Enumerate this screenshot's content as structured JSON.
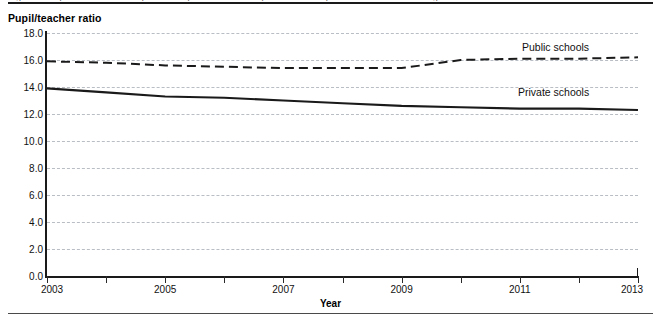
{
  "figure": {
    "clipped_header": "Figure 4. Pupil/teacher ratios in public and private elementary and secondary schools: Fall 2003 through fall 2013",
    "y_axis_title": "Pupil/teacher ratio",
    "x_axis_title": "Year"
  },
  "chart_data": {
    "type": "line",
    "title": "",
    "xlabel": "Year",
    "ylabel": "Pupil/teacher ratio",
    "x": [
      2003,
      2004,
      2005,
      2006,
      2007,
      2008,
      2009,
      2010,
      2011,
      2012,
      2013
    ],
    "xlim": [
      2003,
      2013
    ],
    "ylim": [
      0.0,
      18.0
    ],
    "grid": true,
    "grid_axis": "y",
    "legend_position": "inline-right",
    "x_tick_labels": [
      "2003",
      "2005",
      "2007",
      "2009",
      "2011",
      "2013"
    ],
    "x_tick_values": [
      2003,
      2005,
      2007,
      2009,
      2011,
      2013
    ],
    "x_minor_ticks": [
      2004,
      2006,
      2008,
      2010,
      2012
    ],
    "y_tick_labels": [
      "0.0",
      "2.0",
      "4.0",
      "6.0",
      "8.0",
      "10.0",
      "12.0",
      "14.0",
      "16.0",
      "18.0"
    ],
    "y_tick_values": [
      0.0,
      2.0,
      4.0,
      6.0,
      8.0,
      10.0,
      12.0,
      14.0,
      16.0,
      18.0
    ],
    "series": [
      {
        "name": "Public schools",
        "style": "dashed",
        "color": "#1a1a1a",
        "values": [
          15.9,
          15.8,
          15.6,
          15.5,
          15.4,
          15.4,
          15.4,
          16.0,
          16.1,
          16.1,
          16.2
        ]
      },
      {
        "name": "Private schools",
        "style": "solid",
        "color": "#1a1a1a",
        "values": [
          13.9,
          13.6,
          13.3,
          13.2,
          13.0,
          12.8,
          12.6,
          12.5,
          12.4,
          12.4,
          12.3
        ]
      }
    ]
  }
}
